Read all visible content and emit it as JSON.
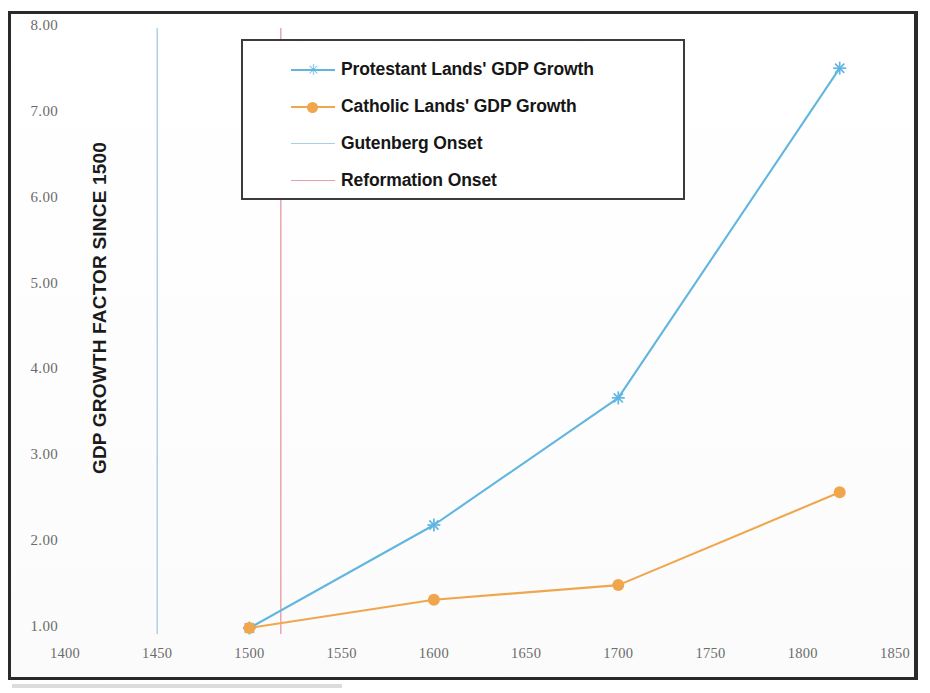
{
  "chart_data": {
    "type": "line",
    "title": "",
    "xlabel": "",
    "ylabel": "GDP GROWTH FACTOR SINCE 1500",
    "xlim": [
      1375,
      1870
    ],
    "ylim": [
      1.0,
      8.0
    ],
    "xticks": [
      1400,
      1450,
      1500,
      1550,
      1600,
      1650,
      1700,
      1750,
      1800,
      1850
    ],
    "xtick_labels": [
      "1400",
      "1450",
      "1500",
      "1550",
      "1600",
      "1650",
      "1700",
      "1750",
      "1800",
      "1850"
    ],
    "yticks": [
      1.0,
      2.0,
      3.0,
      4.0,
      5.0,
      6.0,
      7.0,
      8.0
    ],
    "ytick_labels": [
      "1.00",
      "2.00",
      "3.00",
      "4.00",
      "5.00",
      "6.00",
      "7.00",
      "8.00"
    ],
    "grid": false,
    "legend_position": "upper center",
    "series": [
      {
        "name": "Protestant Lands' GDP Growth",
        "color": "#61b6e0",
        "marker": "star",
        "x": [
          1500,
          1600,
          1700,
          1820
        ],
        "values": [
          1.0,
          2.2,
          3.68,
          7.52
        ]
      },
      {
        "name": "Catholic Lands' GDP Growth",
        "color": "#f0a64d",
        "marker": "circle",
        "x": [
          1500,
          1600,
          1700,
          1820
        ],
        "values": [
          1.0,
          1.33,
          1.5,
          2.58
        ]
      }
    ],
    "vlines": [
      {
        "name": "Gutenberg Onset",
        "color": "#a8cfe8",
        "x": 1450
      },
      {
        "name": "Reformation Onset",
        "color": "#e8a0a8",
        "x": 1517
      }
    ]
  },
  "legend": {
    "entries": [
      {
        "label": "Protestant Lands' GDP Growth",
        "color": "#61b6e0",
        "marker": "star"
      },
      {
        "label": "Catholic Lands' GDP Growth",
        "color": "#f0a64d",
        "marker": "circle"
      },
      {
        "label": "Gutenberg Onset",
        "color": "#a8cfe8",
        "marker": "line"
      },
      {
        "label": "Reformation Onset",
        "color": "#e8a0a8",
        "marker": "line"
      }
    ]
  },
  "colors": {
    "protestant": "#61b6e0",
    "catholic": "#f0a64d",
    "gutenberg": "#a8cfe8",
    "reformation": "#e8a0a8",
    "frame": "#2a2a2a",
    "tick_text": "#6b6b6b",
    "axis_title": "#1b1b1b"
  }
}
